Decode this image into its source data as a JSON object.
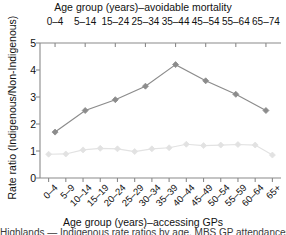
{
  "figure": {
    "top_axis_title": "Age group (years)–avoidable mortality",
    "bottom_axis_title": "Age group (years)–accessing GPs",
    "y_axis_title": "Rate ratio (Indigenous/Non-Indigenous)",
    "caption_clipped": "Highlands — Indigenous rate ratios by age, MBS GP attendances"
  },
  "chart_data": {
    "type": "line",
    "title": "",
    "xlabel": "Age group (years)–accessing GPs",
    "xlabel_top": "Age group (years)–avoidable mortality",
    "ylabel": "Rate ratio (Indigenous/Non-Indigenous)",
    "ylim": [
      0,
      5
    ],
    "yticks": [
      0,
      1,
      2,
      3,
      4,
      5
    ],
    "ytick_labels": [
      "0",
      "1",
      "2",
      "3",
      "4",
      "5"
    ],
    "grid": false,
    "legend": "none",
    "top_axis": {
      "label": "Age group (years)–avoidable mortality",
      "categories": [
        "0–4",
        "5–14",
        "15–24",
        "25–34",
        "35–44",
        "45–54",
        "55–64",
        "65–74"
      ]
    },
    "bottom_axis": {
      "label": "Age group (years)–accessing GPs",
      "categories": [
        "0–4",
        "5–9",
        "10–14",
        "15–19",
        "20–24",
        "25–29",
        "30–34",
        "35–39",
        "40–44",
        "45–49",
        "50–54",
        "55–59",
        "60–64",
        "65+"
      ]
    },
    "series": [
      {
        "name": "Avoidable mortality rate ratio",
        "axis": "top",
        "color": "#8c8c8c",
        "marker": "diamond",
        "categories": [
          "0–4",
          "5–14",
          "15–24",
          "25–34",
          "35–44",
          "45–54",
          "55–64",
          "65–74"
        ],
        "values": [
          1.7,
          2.5,
          2.9,
          3.4,
          4.2,
          3.6,
          3.1,
          2.5
        ]
      },
      {
        "name": "Accessing GPs rate ratio",
        "axis": "bottom",
        "color": "#e2e2e2",
        "marker": "diamond",
        "categories": [
          "0–4",
          "5–9",
          "10–14",
          "15–19",
          "20–24",
          "25–29",
          "30–34",
          "35–39",
          "40–44",
          "45–49",
          "50–54",
          "55–59",
          "60–64",
          "65+"
        ],
        "values": [
          0.88,
          0.89,
          1.04,
          1.1,
          1.08,
          0.98,
          1.08,
          1.12,
          1.25,
          1.2,
          1.22,
          1.24,
          1.22,
          0.85
        ]
      }
    ]
  }
}
